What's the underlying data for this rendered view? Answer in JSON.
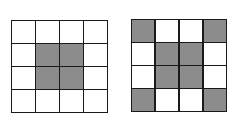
{
  "colors": {
    "filled": "#8c8c8c",
    "empty": "#ffffff",
    "border": "#1a1a1a"
  },
  "grids": [
    {
      "name": "grid-a",
      "rows": 4,
      "cols": 4,
      "cells": [
        [
          0,
          0,
          0,
          0
        ],
        [
          0,
          1,
          1,
          0
        ],
        [
          0,
          1,
          1,
          0
        ],
        [
          0,
          0,
          0,
          0
        ]
      ]
    },
    {
      "name": "grid-b",
      "rows": 4,
      "cols": 4,
      "cells": [
        [
          1,
          0,
          0,
          1
        ],
        [
          0,
          1,
          1,
          0
        ],
        [
          0,
          1,
          1,
          0
        ],
        [
          1,
          0,
          0,
          1
        ]
      ]
    }
  ]
}
